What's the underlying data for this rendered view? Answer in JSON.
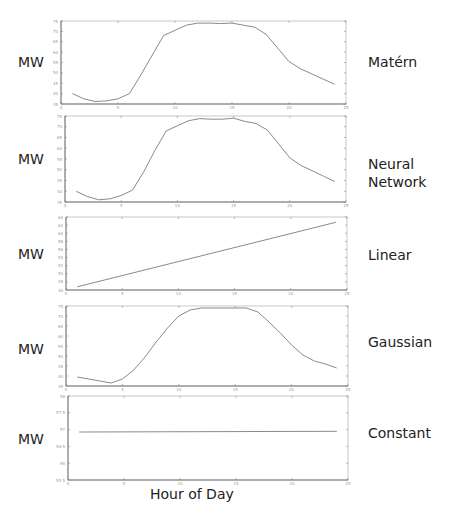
{
  "figure": {
    "xlabel": "Hour of Day",
    "ylabel": "MW"
  },
  "chart_data": [
    {
      "type": "line",
      "title": "Matérn",
      "xlabel": "Hour of Day",
      "ylabel": "MW",
      "xlim": [
        0,
        25
      ],
      "ylim": [
        35,
        75
      ],
      "xticks": [
        0,
        5,
        10,
        15,
        20,
        25
      ],
      "yticks": [
        35,
        40,
        45,
        50,
        55,
        60,
        65,
        70,
        75
      ],
      "grid": false,
      "x": [
        1,
        2,
        3,
        4,
        5,
        6,
        7,
        8,
        9,
        10,
        11,
        12,
        13,
        14,
        15,
        16,
        17,
        18,
        19,
        20,
        21,
        22,
        23,
        24
      ],
      "values": [
        40,
        37.5,
        36.2,
        36.5,
        37.5,
        40,
        49,
        58.5,
        68,
        70.5,
        73,
        74,
        74,
        73.8,
        74,
        73,
        72,
        68.5,
        62,
        55.5,
        52,
        49.5,
        47,
        44.5
      ]
    },
    {
      "type": "line",
      "title": "Neural Network",
      "xlabel": "Hour of Day",
      "ylabel": "MW",
      "xlim": [
        0,
        25
      ],
      "ylim": [
        35,
        75
      ],
      "xticks": [
        0,
        5,
        10,
        15,
        20,
        25
      ],
      "yticks": [
        35,
        40,
        45,
        50,
        55,
        60,
        65,
        70,
        75
      ],
      "grid": false,
      "x": [
        1,
        2,
        3,
        4,
        5,
        6,
        7,
        8,
        9,
        10,
        11,
        12,
        13,
        14,
        15,
        16,
        17,
        18,
        19,
        20,
        21,
        22,
        23,
        24
      ],
      "values": [
        40,
        37.5,
        36,
        36.5,
        38,
        40.5,
        49,
        59,
        68,
        70.5,
        72.8,
        73.8,
        73.5,
        73.5,
        74,
        72.5,
        71.5,
        68.5,
        62,
        55.5,
        52,
        49.5,
        47,
        44.5
      ]
    },
    {
      "type": "line",
      "title": "Linear",
      "xlabel": "Hour of Day",
      "ylabel": "MW",
      "xlim": [
        0,
        25
      ],
      "ylim": [
        46,
        64
      ],
      "xticks": [
        0,
        5,
        10,
        15,
        20,
        25
      ],
      "yticks": [
        46,
        48,
        50,
        52,
        54,
        56,
        58,
        60,
        62,
        64
      ],
      "grid": false,
      "x": [
        1,
        24
      ],
      "values": [
        46.8,
        62.7
      ]
    },
    {
      "type": "line",
      "title": "Gaussian",
      "xlabel": "Hour of Day",
      "ylabel": "MW",
      "xlim": [
        0,
        25
      ],
      "ylim": [
        35,
        75
      ],
      "xticks": [
        0,
        5,
        10,
        15,
        20,
        25
      ],
      "yticks": [
        35,
        40,
        45,
        50,
        55,
        60,
        65,
        70,
        75
      ],
      "grid": false,
      "x": [
        1,
        2,
        3,
        4,
        5,
        6,
        7,
        8,
        9,
        10,
        11,
        12,
        13,
        14,
        15,
        16,
        17,
        18,
        19,
        20,
        21,
        22,
        23,
        24
      ],
      "values": [
        39.5,
        38.5,
        37.5,
        36.5,
        38.5,
        43,
        49.5,
        57,
        64,
        70,
        73,
        74,
        74,
        74,
        74,
        74,
        72,
        67,
        61.5,
        55.5,
        50.5,
        47.5,
        46,
        44
      ]
    },
    {
      "type": "line",
      "title": "Constant",
      "xlabel": "Hour of Day",
      "ylabel": "MW",
      "xlim": [
        0,
        25
      ],
      "ylim": [
        55.5,
        58
      ],
      "xticks": [
        0,
        5,
        10,
        15,
        20,
        25
      ],
      "yticks": [
        55.5,
        56,
        56.5,
        57,
        57.5,
        58
      ],
      "grid": false,
      "x": [
        1,
        24
      ],
      "values": [
        56.93,
        56.95
      ]
    }
  ],
  "panels": [
    {
      "label_lines": [
        "Matérn"
      ],
      "ylabel": "MW"
    },
    {
      "label_lines": [
        "Neural",
        "Network"
      ],
      "ylabel": "MW"
    },
    {
      "label_lines": [
        "Linear"
      ],
      "ylabel": "MW"
    },
    {
      "label_lines": [
        "Gaussian"
      ],
      "ylabel": "MW"
    },
    {
      "label_lines": [
        "Constant"
      ],
      "ylabel": "MW"
    }
  ]
}
